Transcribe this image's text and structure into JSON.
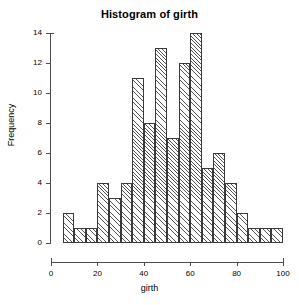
{
  "chart_data": {
    "type": "bar",
    "title": "Histogram of girth",
    "xlabel": "girth",
    "ylabel": "Frequency",
    "grid": false,
    "legend": "none",
    "xlim": [
      0,
      100
    ],
    "ylim": [
      0,
      14
    ],
    "bin_width": 5,
    "xticks": [
      0,
      20,
      40,
      60,
      80,
      100
    ],
    "yticks": [
      0,
      2,
      4,
      6,
      8,
      10,
      12,
      14
    ],
    "bin_starts": [
      5,
      10,
      15,
      20,
      25,
      30,
      35,
      40,
      45,
      50,
      55,
      60,
      65,
      70,
      75,
      80,
      85,
      90,
      95
    ],
    "bin_ends": [
      10,
      15,
      20,
      25,
      30,
      35,
      40,
      45,
      50,
      55,
      60,
      65,
      70,
      75,
      80,
      85,
      90,
      95,
      100
    ],
    "categories": [
      "5-10",
      "10-15",
      "15-20",
      "20-25",
      "25-30",
      "30-35",
      "35-40",
      "40-45",
      "45-50",
      "50-55",
      "55-60",
      "60-65",
      "65-70",
      "70-75",
      "75-80",
      "80-85",
      "85-90",
      "90-95",
      "95-100"
    ],
    "values": [
      2,
      1,
      1,
      4,
      3,
      4,
      11,
      8,
      13,
      7,
      12,
      14,
      5,
      6,
      4,
      2,
      1,
      1,
      1
    ]
  },
  "axis": {
    "x_tick_labels": [
      "0",
      "20",
      "40",
      "60",
      "80",
      "100"
    ],
    "y_tick_labels": [
      "0",
      "2",
      "4",
      "6",
      "8",
      "10",
      "12",
      "14"
    ]
  }
}
